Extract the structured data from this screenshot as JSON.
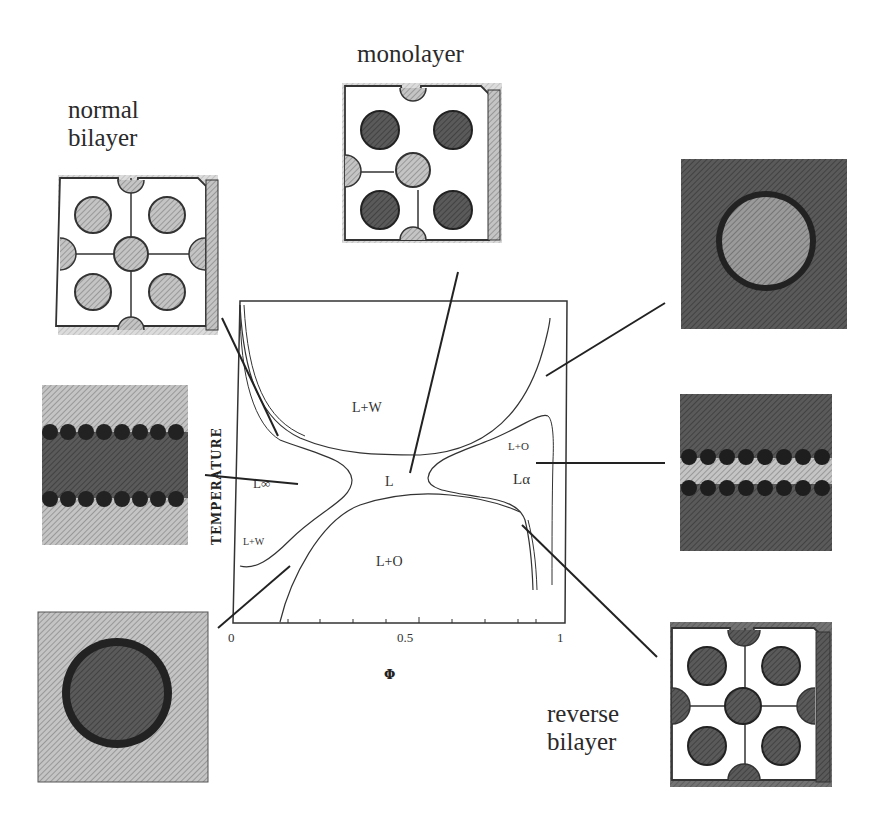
{
  "figure": {
    "labels": {
      "normal_bilayer": "normal\nbilayer",
      "monolayer": "monolayer",
      "reverse_bilayer": "reverse\nbilayer"
    },
    "phase_diagram": {
      "ylabel": "TEMPERATURE",
      "xlabel": "Φ",
      "x_ticks": [
        "0",
        "0.5",
        "1"
      ],
      "regions": {
        "lw_top": "L+W",
        "l_center": "L",
        "lo_bottom": "L+O",
        "l_inf": "L∞",
        "lw_left": "L+W",
        "lo_right": "L+O",
        "l_alpha": "Lα"
      }
    },
    "insets": [
      {
        "name": "normal-bilayer-cubic",
        "type": "bicontinuous cubic structure",
        "position": "top-left"
      },
      {
        "name": "monolayer-cubic",
        "type": "bicontinuous cubic structure",
        "position": "top-center"
      },
      {
        "name": "oil-in-water-micelle",
        "type": "spherical micelle",
        "position": "top-right"
      },
      {
        "name": "lamellar-bilayer-left",
        "type": "lamellar bilayer",
        "position": "middle-left"
      },
      {
        "name": "lamellar-bilayer-right",
        "type": "lamellar bilayer",
        "position": "middle-right"
      },
      {
        "name": "water-in-oil-micelle",
        "type": "spherical micelle",
        "position": "bottom-left"
      },
      {
        "name": "reverse-bilayer-cubic",
        "type": "bicontinuous cubic structure",
        "position": "bottom-right"
      }
    ],
    "colors": {
      "ink": "#2a2a2a",
      "dark_fill": "#4a4a4a",
      "mid_fill": "#8a8a8a",
      "light_fill": "#b8b8b8",
      "background": "#ffffff"
    }
  }
}
